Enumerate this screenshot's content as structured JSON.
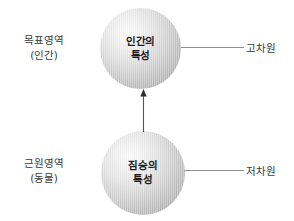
{
  "diagram": {
    "title": "",
    "background_color": "#ffffff",
    "left_labels": [
      {
        "name": "target-domain",
        "line1": "목표영역",
        "line2": "(인간)"
      },
      {
        "name": "source-domain",
        "line1": "근원영역",
        "line2": "(동물)"
      }
    ],
    "right_labels": [
      {
        "name": "high-dimension",
        "text": "고차원"
      },
      {
        "name": "low-dimension",
        "text": "저차원"
      }
    ],
    "nodes": [
      {
        "name": "human-characteristics",
        "line1": "인간의",
        "line2": "특성",
        "shape": "sphere",
        "fill_center": "#fbfbfb",
        "fill_edge": "#a2a2a2"
      },
      {
        "name": "beast-characteristics",
        "line1": "짐승의",
        "line2": "특성",
        "shape": "sphere",
        "fill_center": "#fbfbfb",
        "fill_edge": "#a2a2a2"
      }
    ],
    "arrow": {
      "name": "mapping-arrow",
      "direction": "up",
      "from": "beast-characteristics",
      "to": "human-characteristics",
      "color": "#555555"
    },
    "connectors": {
      "color": "#8f8f8f",
      "top_label": "고차원",
      "bottom_label": "저차원"
    }
  }
}
